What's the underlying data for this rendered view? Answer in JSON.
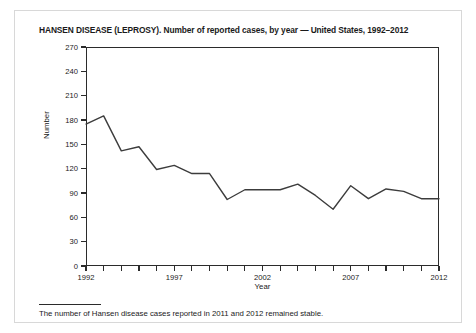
{
  "figure": {
    "title": "HANSEN DISEASE (LEPROSY). Number of reported cases, by year — United States, 1992–2012",
    "footnote": "The number of Hansen disease cases reported in 2011 and 2012 remained stable.",
    "line_color": "#3c3c3c",
    "axis_color": "#2b2b2b",
    "background_color": "#ffffff"
  },
  "chart_data": {
    "type": "line",
    "title": "HANSEN DISEASE (LEPROSY). Number of reported cases, by year — United States, 1992–2012",
    "xlabel": "Year",
    "ylabel": "Number",
    "x": [
      1992,
      1993,
      1994,
      1995,
      1996,
      1997,
      1998,
      1999,
      2000,
      2001,
      2002,
      2003,
      2004,
      2005,
      2006,
      2007,
      2008,
      2009,
      2010,
      2011,
      2012
    ],
    "values": [
      175,
      185,
      142,
      147,
      119,
      124,
      114,
      114,
      82,
      94,
      94,
      94,
      101,
      87,
      70,
      99,
      83,
      95,
      92,
      83,
      83
    ],
    "ylim": [
      0,
      270
    ],
    "xlim": [
      1992,
      2012
    ],
    "yticks": [
      0,
      30,
      60,
      90,
      120,
      150,
      180,
      210,
      240,
      270
    ],
    "xticks": [
      1992,
      1997,
      2002,
      2007,
      2012
    ],
    "xtick_labels": [
      "1992",
      "1997",
      "2002",
      "2007",
      "2012"
    ],
    "xtick_all": [
      1992,
      1993,
      1994,
      1995,
      1996,
      1997,
      1998,
      1999,
      2000,
      2001,
      2002,
      2003,
      2004,
      2005,
      2006,
      2007,
      2008,
      2009,
      2010,
      2011,
      2012
    ],
    "grid": false,
    "legend": null
  }
}
